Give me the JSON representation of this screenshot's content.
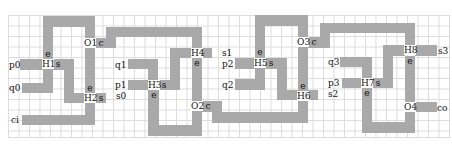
{
  "diagram": {
    "type": "grid-circuit-layout",
    "grid": {
      "cell_px": 10.5,
      "color": "#dcdcdc"
    },
    "wire_color": "#a9a9a9",
    "inputs": [
      {
        "label": "p0",
        "x": 9,
        "y": 60
      },
      {
        "label": "q0",
        "x": 9,
        "y": 83
      },
      {
        "label": "ci",
        "x": 11,
        "y": 115
      },
      {
        "label": "q1",
        "x": 115,
        "y": 60
      },
      {
        "label": "p1",
        "x": 115,
        "y": 80
      },
      {
        "label": "s0",
        "x": 116,
        "y": 91
      },
      {
        "label": "s1",
        "x": 222,
        "y": 48
      },
      {
        "label": "p2",
        "x": 222,
        "y": 59
      },
      {
        "label": "q2",
        "x": 222,
        "y": 80
      },
      {
        "label": "q3",
        "x": 328,
        "y": 57
      },
      {
        "label": "p3",
        "x": 328,
        "y": 78
      },
      {
        "label": "s2",
        "x": 328,
        "y": 89
      },
      {
        "label": "s3",
        "x": 438,
        "y": 46
      },
      {
        "label": "co",
        "x": 437,
        "y": 103
      }
    ],
    "nodes": [
      {
        "id": "H1",
        "x": 42,
        "y": 59
      },
      {
        "id": "H2",
        "x": 84,
        "y": 93
      },
      {
        "id": "O1",
        "x": 84,
        "y": 38
      },
      {
        "id": "H3",
        "x": 148,
        "y": 80
      },
      {
        "id": "H4",
        "x": 191,
        "y": 48
      },
      {
        "id": "O2",
        "x": 191,
        "y": 101
      },
      {
        "id": "H5",
        "x": 254,
        "y": 58
      },
      {
        "id": "H6",
        "x": 297,
        "y": 91
      },
      {
        "id": "O3",
        "x": 297,
        "y": 37
      },
      {
        "id": "H7",
        "x": 361,
        "y": 78
      },
      {
        "id": "H8",
        "x": 404,
        "y": 45
      },
      {
        "id": "O4",
        "x": 404,
        "y": 102
      }
    ],
    "ports": [
      {
        "label": "e",
        "x": 43,
        "y": 49
      },
      {
        "label": "s",
        "x": 53,
        "y": 59
      },
      {
        "label": "e",
        "x": 85,
        "y": 83
      },
      {
        "label": "s",
        "x": 96,
        "y": 93
      },
      {
        "label": "c",
        "x": 96,
        "y": 38
      },
      {
        "label": "s",
        "x": 159,
        "y": 80
      },
      {
        "label": "e",
        "x": 149,
        "y": 90
      },
      {
        "label": "e",
        "x": 192,
        "y": 58
      },
      {
        "label": "c",
        "x": 203,
        "y": 101
      },
      {
        "label": "e",
        "x": 255,
        "y": 47
      },
      {
        "label": "s",
        "x": 266,
        "y": 58
      },
      {
        "label": "e",
        "x": 298,
        "y": 81
      },
      {
        "label": "c",
        "x": 309,
        "y": 37
      },
      {
        "label": "s",
        "x": 373,
        "y": 78
      },
      {
        "label": "e",
        "x": 362,
        "y": 88
      },
      {
        "label": "e",
        "x": 405,
        "y": 56
      }
    ],
    "wires": [
      {
        "x": 43,
        "y": 16,
        "w": 52,
        "h": 11
      },
      {
        "x": 43,
        "y": 16,
        "w": 10,
        "h": 43
      },
      {
        "x": 85,
        "y": 16,
        "w": 10,
        "h": 22
      },
      {
        "x": 85,
        "y": 48,
        "w": 10,
        "h": 45
      },
      {
        "x": 20,
        "y": 59,
        "w": 23,
        "h": 11
      },
      {
        "x": 53,
        "y": 59,
        "w": 21,
        "h": 11
      },
      {
        "x": 64,
        "y": 59,
        "w": 10,
        "h": 44
      },
      {
        "x": 64,
        "y": 93,
        "w": 21,
        "h": 10
      },
      {
        "x": 43,
        "y": 69,
        "w": 10,
        "h": 24
      },
      {
        "x": 22,
        "y": 83,
        "w": 31,
        "h": 10
      },
      {
        "x": 95,
        "y": 93,
        "w": 11,
        "h": 10
      },
      {
        "x": 85,
        "y": 103,
        "w": 10,
        "h": 22
      },
      {
        "x": 22,
        "y": 115,
        "w": 73,
        "h": 10
      },
      {
        "x": 95,
        "y": 38,
        "w": 21,
        "h": 10
      },
      {
        "x": 106,
        "y": 27,
        "w": 10,
        "h": 21
      },
      {
        "x": 106,
        "y": 27,
        "w": 96,
        "h": 10
      },
      {
        "x": 192,
        "y": 27,
        "w": 10,
        "h": 21
      },
      {
        "x": 202,
        "y": 48,
        "w": 10,
        "h": 10
      },
      {
        "x": 170,
        "y": 48,
        "w": 22,
        "h": 10
      },
      {
        "x": 170,
        "y": 48,
        "w": 10,
        "h": 42
      },
      {
        "x": 128,
        "y": 59,
        "w": 30,
        "h": 10
      },
      {
        "x": 148,
        "y": 59,
        "w": 10,
        "h": 21
      },
      {
        "x": 128,
        "y": 80,
        "w": 20,
        "h": 10
      },
      {
        "x": 159,
        "y": 80,
        "w": 21,
        "h": 10
      },
      {
        "x": 148,
        "y": 90,
        "w": 11,
        "h": 46
      },
      {
        "x": 148,
        "y": 125,
        "w": 54,
        "h": 11
      },
      {
        "x": 192,
        "y": 58,
        "w": 10,
        "h": 43
      },
      {
        "x": 192,
        "y": 111,
        "w": 10,
        "h": 25
      },
      {
        "x": 202,
        "y": 101,
        "w": 20,
        "h": 11
      },
      {
        "x": 212,
        "y": 101,
        "w": 10,
        "h": 22
      },
      {
        "x": 212,
        "y": 112,
        "w": 96,
        "h": 11
      },
      {
        "x": 255,
        "y": 15,
        "w": 53,
        "h": 11
      },
      {
        "x": 255,
        "y": 15,
        "w": 10,
        "h": 43
      },
      {
        "x": 298,
        "y": 15,
        "w": 10,
        "h": 22
      },
      {
        "x": 235,
        "y": 58,
        "w": 20,
        "h": 11
      },
      {
        "x": 265,
        "y": 58,
        "w": 22,
        "h": 11
      },
      {
        "x": 277,
        "y": 58,
        "w": 10,
        "h": 42
      },
      {
        "x": 277,
        "y": 90,
        "w": 21,
        "h": 10
      },
      {
        "x": 255,
        "y": 68,
        "w": 10,
        "h": 22
      },
      {
        "x": 235,
        "y": 79,
        "w": 30,
        "h": 11
      },
      {
        "x": 298,
        "y": 47,
        "w": 10,
        "h": 44
      },
      {
        "x": 298,
        "y": 101,
        "w": 10,
        "h": 22
      },
      {
        "x": 308,
        "y": 90,
        "w": 10,
        "h": 10
      },
      {
        "x": 308,
        "y": 37,
        "w": 22,
        "h": 11
      },
      {
        "x": 320,
        "y": 23,
        "w": 10,
        "h": 25
      },
      {
        "x": 320,
        "y": 23,
        "w": 95,
        "h": 10
      },
      {
        "x": 405,
        "y": 23,
        "w": 10,
        "h": 22
      },
      {
        "x": 415,
        "y": 45,
        "w": 22,
        "h": 11
      },
      {
        "x": 383,
        "y": 45,
        "w": 22,
        "h": 11
      },
      {
        "x": 383,
        "y": 45,
        "w": 10,
        "h": 43
      },
      {
        "x": 340,
        "y": 57,
        "w": 32,
        "h": 10
      },
      {
        "x": 362,
        "y": 57,
        "w": 10,
        "h": 21
      },
      {
        "x": 342,
        "y": 78,
        "w": 20,
        "h": 10
      },
      {
        "x": 372,
        "y": 78,
        "w": 21,
        "h": 10
      },
      {
        "x": 362,
        "y": 88,
        "w": 10,
        "h": 45
      },
      {
        "x": 362,
        "y": 122,
        "w": 53,
        "h": 11
      },
      {
        "x": 405,
        "y": 56,
        "w": 10,
        "h": 46
      },
      {
        "x": 405,
        "y": 112,
        "w": 10,
        "h": 21
      },
      {
        "x": 415,
        "y": 102,
        "w": 22,
        "h": 10
      }
    ]
  }
}
